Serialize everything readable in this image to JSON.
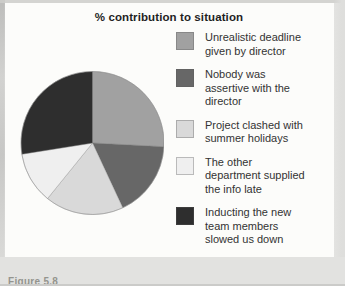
{
  "page": {
    "caption": "Figure 5.8"
  },
  "chart_data": {
    "type": "pie",
    "title": "% contribution to situation",
    "legend_position": "right",
    "start_angle_deg": 0,
    "direction": "clockwise",
    "slices": [
      {
        "label": "Unrealistic deadline given by director",
        "legend_lines": [
          "Unrealistic deadline",
          "given by director"
        ],
        "percent": 26,
        "angle_deg": 93,
        "color": "#a1a1a1"
      },
      {
        "label": "Nobody was assertive with the director",
        "legend_lines": [
          "Nobody was",
          "assertive with the",
          "director"
        ],
        "percent": 17,
        "angle_deg": 62,
        "color": "#676767"
      },
      {
        "label": "Project clashed with summer holidays",
        "legend_lines": [
          "Project clashed with",
          "summer holidays"
        ],
        "percent": 18,
        "angle_deg": 64,
        "color": "#d9d9d9"
      },
      {
        "label": "The other department supplied the info late",
        "legend_lines": [
          "The other",
          "department supplied",
          "the info late"
        ],
        "percent": 12,
        "angle_deg": 42,
        "color": "#efefef"
      },
      {
        "label": "Inducting the new team members slowed us down",
        "legend_lines": [
          "Inducting the new",
          "team members",
          "slowed us down"
        ],
        "percent": 27,
        "angle_deg": 99,
        "color": "#2e2e2e"
      }
    ]
  },
  "colors": {
    "panel_bg": "#fcfcfa",
    "margin_bg": "#e2e2e0",
    "title_text": "#1f1f1f",
    "label_text": "#333333",
    "caption_text": "#94948e",
    "slice_outline": "#8f8f8f"
  }
}
